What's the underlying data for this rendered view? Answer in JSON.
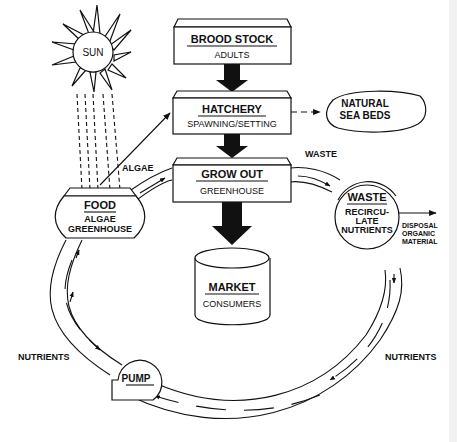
{
  "diagram": {
    "type": "aquaculture-flow-diagram",
    "nodes": {
      "brood_stock": {
        "title": "BROOD STOCK",
        "subtitle": "ADULTS"
      },
      "hatchery": {
        "title": "HATCHERY",
        "subtitle": "SPAWNING/SETTING"
      },
      "grow_out": {
        "title": "GROW OUT",
        "subtitle": "GREENHOUSE"
      },
      "market": {
        "title": "MARKET",
        "subtitle": "CONSUMERS"
      },
      "food": {
        "title": "FOOD",
        "subtitle_1": "ALGAE",
        "subtitle_2": "GREENHOUSE"
      },
      "waste": {
        "title": "WASTE",
        "subtitle_1": "RECIRCU-",
        "subtitle_2": "LATE",
        "subtitle_3": "NUTRIENTS"
      },
      "natural_sea_beds": {
        "line_1": "NATURAL",
        "line_2": "SEA BEDS"
      },
      "sun": {
        "label": "SUN"
      },
      "pump": {
        "label": "PUMP"
      }
    },
    "edge_labels": {
      "algae": "ALGAE",
      "waste": "WASTE",
      "nutrients_left": "NUTRIENTS",
      "nutrients_right": "NUTRIENTS",
      "disposal_1": "DISPOSAL",
      "disposal_2": "ORGANIC",
      "disposal_3": "MATERIAL"
    },
    "edges": [
      {
        "from": "BROOD STOCK",
        "to": "HATCHERY",
        "style": "thick-arrow"
      },
      {
        "from": "HATCHERY",
        "to": "GROW OUT",
        "style": "thick-arrow"
      },
      {
        "from": "GROW OUT",
        "to": "MARKET",
        "style": "thick-arrow"
      },
      {
        "from": "HATCHERY",
        "to": "NATURAL SEA BEDS",
        "style": "dashed-arrow"
      },
      {
        "from": "SUN",
        "to": "FOOD",
        "style": "dashed-rays"
      },
      {
        "from": "FOOD",
        "to": "HATCHERY",
        "style": "thin-arrow"
      },
      {
        "from": "FOOD",
        "to": "GROW OUT",
        "label": "ALGAE",
        "style": "pipe"
      },
      {
        "from": "GROW OUT",
        "to": "WASTE",
        "label": "WASTE",
        "style": "pipe"
      },
      {
        "from": "WASTE",
        "to": "DISPOSAL ORGANIC MATERIAL",
        "style": "thin-arrow"
      },
      {
        "from": "WASTE",
        "to": "PUMP",
        "label": "NUTRIENTS",
        "style": "pipe"
      },
      {
        "from": "PUMP",
        "to": "FOOD",
        "label": "NUTRIENTS",
        "style": "pipe"
      }
    ]
  }
}
